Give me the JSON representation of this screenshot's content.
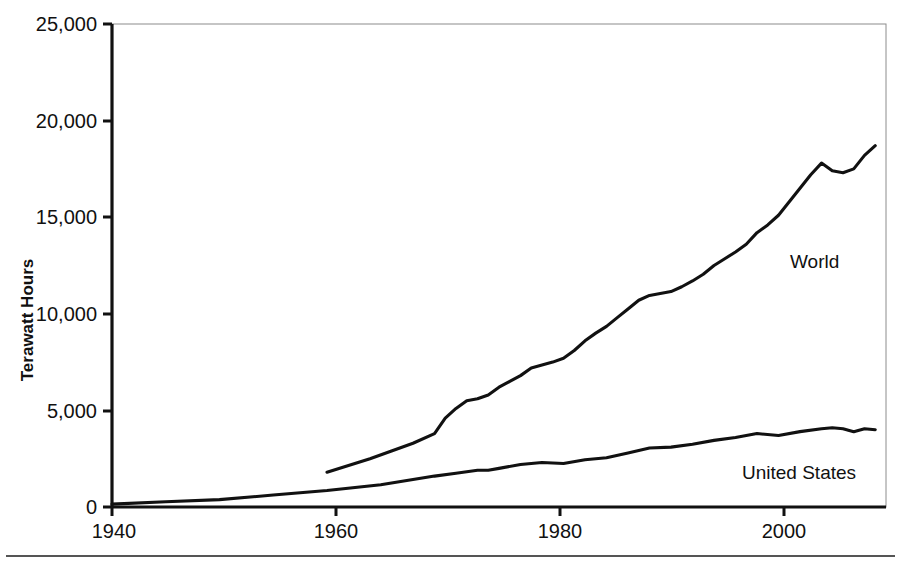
{
  "chart_data": {
    "type": "line",
    "title": "",
    "xlabel": "",
    "ylabel": "Terawatt Hours",
    "xlim": [
      1940,
      2012
    ],
    "ylim": [
      0,
      25000
    ],
    "grid": false,
    "legend_position": "inline-annotations",
    "x_ticks": [
      "1940",
      "1960",
      "1980",
      "2000"
    ],
    "x_tick_values": [
      1940,
      1960,
      1980,
      2000
    ],
    "y_ticks": [
      "0",
      "5,000",
      "10,000",
      "15,000",
      "20,000",
      "25,000"
    ],
    "y_tick_values": [
      0,
      5000,
      10000,
      15000,
      20000,
      25000
    ],
    "series": [
      {
        "name": "World",
        "color": "#111111",
        "x": [
          1960,
          1962,
          1964,
          1966,
          1968,
          1970,
          1971,
          1972,
          1973,
          1974,
          1975,
          1976,
          1977,
          1978,
          1979,
          1980,
          1981,
          1982,
          1983,
          1984,
          1985,
          1986,
          1987,
          1988,
          1989,
          1990,
          1991,
          1992,
          1993,
          1994,
          1995,
          1996,
          1997,
          1998,
          1999,
          2000,
          2001,
          2002,
          2003,
          2004,
          2005,
          2006,
          2007,
          2008,
          2009,
          2010,
          2011
        ],
        "values": [
          1800,
          2150,
          2500,
          2900,
          3300,
          3800,
          4600,
          5100,
          5500,
          5600,
          5800,
          6200,
          6500,
          6800,
          7200,
          7350,
          7500,
          7700,
          8100,
          8600,
          9000,
          9350,
          9800,
          10250,
          10700,
          10950,
          11050,
          11150,
          11400,
          11700,
          12050,
          12500,
          12850,
          13200,
          13600,
          14200,
          14600,
          15100,
          15800,
          16500,
          17200,
          17800,
          17400,
          17300,
          17500,
          18200,
          18700
        ]
      },
      {
        "name": "United States",
        "color": "#111111",
        "x": [
          1940,
          1945,
          1950,
          1955,
          1960,
          1965,
          1970,
          1972,
          1974,
          1975,
          1976,
          1978,
          1980,
          1982,
          1984,
          1986,
          1988,
          1990,
          1992,
          1994,
          1996,
          1998,
          2000,
          2002,
          2004,
          2006,
          2007,
          2008,
          2009,
          2010,
          2011
        ],
        "values": [
          150,
          270,
          380,
          620,
          850,
          1150,
          1600,
          1750,
          1900,
          1900,
          2000,
          2200,
          2300,
          2250,
          2450,
          2550,
          2800,
          3050,
          3100,
          3250,
          3450,
          3600,
          3800,
          3700,
          3900,
          4050,
          4100,
          4050,
          3900,
          4050,
          4000
        ]
      }
    ],
    "annotations": [
      {
        "text": "World",
        "x_px": 790,
        "y_px": 262
      },
      {
        "text": "United States",
        "x_px": 742,
        "y_px": 472
      }
    ]
  },
  "figure": {
    "ylabel": "Terawatt Hours",
    "series_labels": {
      "world": "World",
      "united_states": "United States"
    },
    "y_tick_labels": [
      "25,000",
      "20,000",
      "15,000",
      "10,000",
      "5,000",
      "0"
    ],
    "x_tick_labels": [
      "1940",
      "1960",
      "1980",
      "2000"
    ]
  }
}
